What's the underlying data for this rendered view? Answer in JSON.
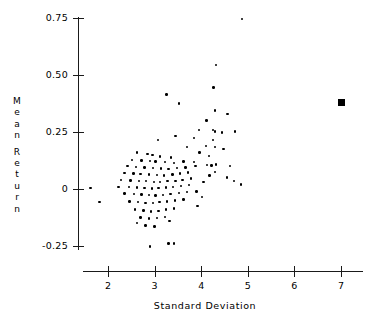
{
  "chart_data": {
    "type": "scatter",
    "title": "",
    "xlabel": "Standard Deviation",
    "ylabel": "Mean Return",
    "xlim": [
      1.3,
      7.4
    ],
    "ylim": [
      -0.31,
      0.79
    ],
    "grid": false,
    "legend": "none",
    "xticks": [
      2,
      3,
      4,
      5,
      6,
      7
    ],
    "xticklabels": [
      "2",
      "3",
      "4",
      "5",
      "6",
      "7"
    ],
    "yticks": [
      -0.25,
      0,
      0.25,
      0.5,
      0.75
    ],
    "yticklabels": [
      "-0.25",
      "0",
      "0.25",
      "0.50",
      "0.75"
    ],
    "series": [
      {
        "name": "assets",
        "marker": "dot",
        "color": "#000000",
        "points": [
          [
            4.88,
            0.745
          ],
          [
            4.32,
            0.545
          ],
          [
            3.25,
            0.415
          ],
          [
            4.26,
            0.445
          ],
          [
            3.52,
            0.375
          ],
          [
            4.3,
            0.345
          ],
          [
            4.56,
            0.33
          ],
          [
            4.11,
            0.3
          ],
          [
            4.25,
            0.258
          ],
          [
            4.3,
            0.252
          ],
          [
            4.45,
            0.248
          ],
          [
            4.73,
            0.252
          ],
          [
            3.45,
            0.233
          ],
          [
            4.25,
            0.215
          ],
          [
            4.1,
            0.188
          ],
          [
            4.3,
            0.185
          ],
          [
            4.48,
            0.175
          ],
          [
            3.96,
            0.16
          ],
          [
            4.16,
            0.145
          ],
          [
            3.84,
            0.118
          ],
          [
            3.88,
            0.102
          ],
          [
            4.12,
            0.106
          ],
          [
            4.22,
            0.104
          ],
          [
            4.32,
            0.108
          ],
          [
            4.62,
            0.1
          ],
          [
            4.29,
            0.075
          ],
          [
            4.18,
            0.06
          ],
          [
            3.07,
            0.215
          ],
          [
            2.62,
            0.16
          ],
          [
            2.85,
            0.155
          ],
          [
            2.95,
            0.15
          ],
          [
            3.12,
            0.142
          ],
          [
            3.35,
            0.138
          ],
          [
            2.52,
            0.128
          ],
          [
            2.72,
            0.125
          ],
          [
            2.9,
            0.122
          ],
          [
            3.02,
            0.12
          ],
          [
            3.22,
            0.118
          ],
          [
            3.42,
            0.114
          ],
          [
            3.62,
            0.12
          ],
          [
            2.42,
            0.1
          ],
          [
            2.6,
            0.098
          ],
          [
            2.78,
            0.095
          ],
          [
            2.96,
            0.092
          ],
          [
            3.14,
            0.09
          ],
          [
            3.3,
            0.088
          ],
          [
            3.48,
            0.092
          ],
          [
            3.66,
            0.095
          ],
          [
            2.35,
            0.07
          ],
          [
            2.55,
            0.068
          ],
          [
            2.7,
            0.066
          ],
          [
            2.88,
            0.064
          ],
          [
            3.05,
            0.062
          ],
          [
            3.2,
            0.06
          ],
          [
            3.38,
            0.064
          ],
          [
            3.55,
            0.068
          ],
          [
            3.72,
            0.072
          ],
          [
            2.28,
            0.04
          ],
          [
            2.48,
            0.038
          ],
          [
            2.66,
            0.036
          ],
          [
            2.82,
            0.034
          ],
          [
            2.98,
            0.032
          ],
          [
            3.12,
            0.03
          ],
          [
            3.28,
            0.034
          ],
          [
            3.45,
            0.036
          ],
          [
            3.6,
            0.04
          ],
          [
            3.78,
            0.046
          ],
          [
            2.22,
            0.01
          ],
          [
            2.45,
            0.008
          ],
          [
            2.62,
            0.006
          ],
          [
            2.78,
            0.004
          ],
          [
            2.94,
            0.002
          ],
          [
            3.08,
            0.004
          ],
          [
            3.24,
            0.006
          ],
          [
            3.4,
            0.01
          ],
          [
            3.56,
            0.014
          ],
          [
            3.74,
            0.018
          ],
          [
            1.62,
            0.005
          ],
          [
            2.35,
            -0.02
          ],
          [
            2.56,
            -0.022
          ],
          [
            2.72,
            -0.024
          ],
          [
            2.88,
            -0.026
          ],
          [
            3.02,
            -0.028
          ],
          [
            3.18,
            -0.026
          ],
          [
            3.34,
            -0.022
          ],
          [
            3.52,
            -0.018
          ],
          [
            3.7,
            -0.014
          ],
          [
            3.9,
            -0.01
          ],
          [
            1.82,
            -0.058
          ],
          [
            2.46,
            -0.055
          ],
          [
            2.64,
            -0.058
          ],
          [
            2.8,
            -0.06
          ],
          [
            2.96,
            -0.062
          ],
          [
            3.1,
            -0.058
          ],
          [
            3.26,
            -0.054
          ],
          [
            3.44,
            -0.05
          ],
          [
            3.62,
            -0.046
          ],
          [
            2.58,
            -0.09
          ],
          [
            2.76,
            -0.094
          ],
          [
            2.92,
            -0.098
          ],
          [
            3.08,
            -0.095
          ],
          [
            3.24,
            -0.09
          ],
          [
            3.42,
            -0.086
          ],
          [
            2.7,
            -0.125
          ],
          [
            2.88,
            -0.13
          ],
          [
            3.05,
            -0.128
          ],
          [
            3.22,
            -0.122
          ],
          [
            2.8,
            -0.16
          ],
          [
            3.0,
            -0.165
          ],
          [
            2.62,
            -0.15
          ],
          [
            3.32,
            -0.14
          ],
          [
            3.3,
            -0.238
          ],
          [
            3.42,
            -0.238
          ],
          [
            2.9,
            -0.252
          ],
          [
            4.05,
            0.03
          ],
          [
            4.02,
            -0.035
          ],
          [
            3.92,
            -0.075
          ],
          [
            4.55,
            0.05
          ],
          [
            4.7,
            0.035
          ],
          [
            4.85,
            0.02
          ],
          [
            3.85,
            0.225
          ],
          [
            3.7,
            0.185
          ],
          [
            3.95,
            0.258
          ]
        ]
      },
      {
        "name": "market-portfolio",
        "marker": "filled-square",
        "color": "#000000",
        "points": [
          [
            7.0,
            0.378
          ]
        ]
      }
    ]
  },
  "axes": {
    "y_title_chars": [
      "M",
      "e",
      "a",
      "n",
      "",
      "R",
      "e",
      "t",
      "u",
      "r",
      "n"
    ]
  }
}
